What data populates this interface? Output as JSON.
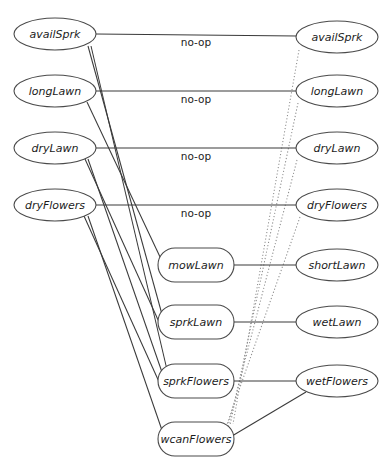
{
  "diagram": {
    "canvas": {
      "width": 387,
      "height": 471
    },
    "colors": {
      "background": "#ffffff",
      "node_stroke": "#4a4a4a",
      "node_fill": "#ffffff",
      "label_text": "#1c1c1c",
      "edge_solid": "#3a3a3a",
      "edge_dotted": "#8d8d8d"
    },
    "nodes": [
      {
        "id": "availSprk_l",
        "label": "availSprk",
        "shape": "ellipse",
        "cx": 55,
        "cy": 34,
        "rx": 41,
        "ry": 16
      },
      {
        "id": "longLawn_l",
        "label": "longLawn",
        "shape": "ellipse",
        "cx": 55,
        "cy": 91,
        "rx": 41,
        "ry": 16
      },
      {
        "id": "dryLawn_l",
        "label": "dryLawn",
        "shape": "ellipse",
        "cx": 55,
        "cy": 148,
        "rx": 41,
        "ry": 16
      },
      {
        "id": "dryFlowers_l",
        "label": "dryFlowers",
        "shape": "ellipse",
        "cx": 55,
        "cy": 205,
        "rx": 41,
        "ry": 16
      },
      {
        "id": "mowLawn",
        "label": "mowLawn",
        "shape": "roundrect",
        "cx": 196,
        "cy": 265,
        "rx": 38,
        "ry": 17
      },
      {
        "id": "sprkLawn",
        "label": "sprkLawn",
        "shape": "roundrect",
        "cx": 196,
        "cy": 322,
        "rx": 38,
        "ry": 17
      },
      {
        "id": "sprkFlowers",
        "label": "sprkFlowers",
        "shape": "roundrect",
        "cx": 196,
        "cy": 381,
        "rx": 38,
        "ry": 17
      },
      {
        "id": "wcanFlowers",
        "label": "wcanFlowers",
        "shape": "roundrect",
        "cx": 196,
        "cy": 439,
        "rx": 38,
        "ry": 17
      },
      {
        "id": "availSprk_r",
        "label": "availSprk",
        "shape": "ellipse",
        "cx": 337,
        "cy": 37,
        "rx": 41,
        "ry": 16
      },
      {
        "id": "longLawn_r",
        "label": "longLawn",
        "shape": "ellipse",
        "cx": 337,
        "cy": 91,
        "rx": 41,
        "ry": 16
      },
      {
        "id": "dryLawn_r",
        "label": "dryLawn",
        "shape": "ellipse",
        "cx": 337,
        "cy": 148,
        "rx": 41,
        "ry": 16
      },
      {
        "id": "dryFlowers_r",
        "label": "dryFlowers",
        "shape": "ellipse",
        "cx": 337,
        "cy": 205,
        "rx": 41,
        "ry": 16
      },
      {
        "id": "shortLawn",
        "label": "shortLawn",
        "shape": "ellipse",
        "cx": 337,
        "cy": 265,
        "rx": 41,
        "ry": 16
      },
      {
        "id": "wetLawn",
        "label": "wetLawn",
        "shape": "ellipse",
        "cx": 337,
        "cy": 322,
        "rx": 41,
        "ry": 16
      },
      {
        "id": "wetFlowers",
        "label": "wetFlowers",
        "shape": "ellipse",
        "cx": 337,
        "cy": 381,
        "rx": 41,
        "ry": 16
      }
    ],
    "edge_labels": [
      {
        "text": "no-op",
        "x": 196,
        "y": 38
      },
      {
        "text": "no-op",
        "x": 196,
        "y": 95
      },
      {
        "text": "no-op",
        "x": 196,
        "y": 152
      },
      {
        "text": "no-op",
        "x": 196,
        "y": 209
      }
    ],
    "edges_solid_horizontal": [
      {
        "from": "availSprk_l",
        "to": "availSprk_r",
        "x1": 96,
        "y1": 34,
        "x2": 297,
        "y2": 36
      },
      {
        "from": "longLawn_l",
        "to": "longLawn_r",
        "x1": 96,
        "y1": 91,
        "x2": 297,
        "y2": 91
      },
      {
        "from": "dryLawn_l",
        "to": "dryLawn_r",
        "x1": 96,
        "y1": 148,
        "x2": 297,
        "y2": 148
      },
      {
        "from": "dryFlowers_l",
        "to": "dryFlowers_r",
        "x1": 96,
        "y1": 205,
        "x2": 297,
        "y2": 205
      },
      {
        "from": "mowLawn",
        "to": "shortLawn",
        "x1": 234,
        "y1": 265,
        "x2": 297,
        "y2": 265
      },
      {
        "from": "sprkLawn",
        "to": "wetLawn",
        "x1": 234,
        "y1": 322,
        "x2": 297,
        "y2": 322
      },
      {
        "from": "sprkFlowers",
        "to": "wetFlowers",
        "x1": 234,
        "y1": 381,
        "x2": 297,
        "y2": 381
      }
    ],
    "edges_solid_fan": [
      {
        "from": "availSprk_l",
        "to": "sprkLawn",
        "x1": 88,
        "y1": 46,
        "x2": 163,
        "y2": 318
      },
      {
        "from": "availSprk_l",
        "to": "sprkFlowers",
        "x1": 91,
        "y1": 46,
        "x2": 168,
        "y2": 374
      },
      {
        "from": "longLawn_l",
        "to": "mowLawn",
        "x1": 87,
        "y1": 102,
        "x2": 161,
        "y2": 259
      },
      {
        "from": "dryLawn_l",
        "to": "sprkLawn",
        "x1": 85,
        "y1": 159,
        "x2": 159,
        "y2": 322
      },
      {
        "from": "dryLawn_l",
        "to": "sprkFlowers",
        "x1": 88,
        "y1": 159,
        "x2": 164,
        "y2": 378
      },
      {
        "from": "dryFlowers_l",
        "to": "sprkFlowers",
        "x1": 84,
        "y1": 216,
        "x2": 160,
        "y2": 384
      },
      {
        "from": "dryFlowers_l",
        "to": "wcanFlowers",
        "x1": 88,
        "y1": 216,
        "x2": 164,
        "y2": 436
      }
    ],
    "edges_solid_other": [
      {
        "from": "wcanFlowers",
        "to": "wetFlowers",
        "x1": 232,
        "y1": 436,
        "x2": 306,
        "y2": 392
      }
    ],
    "edges_dotted": [
      {
        "from": "availSprk_r",
        "to": "wcanFlowers",
        "x1": 299,
        "y1": 50,
        "x2": 233,
        "y2": 424
      },
      {
        "from": "longLawn_r",
        "to": "wcanFlowers",
        "x1": 298,
        "y1": 103,
        "x2": 230,
        "y2": 425
      },
      {
        "from": "dryLawn_r",
        "to": "wcanFlowers",
        "x1": 297,
        "y1": 160,
        "x2": 228,
        "y2": 426
      },
      {
        "from": "dryFlowers_r",
        "to": "wcanFlowers",
        "x1": 300,
        "y1": 217,
        "x2": 226,
        "y2": 427
      }
    ]
  }
}
